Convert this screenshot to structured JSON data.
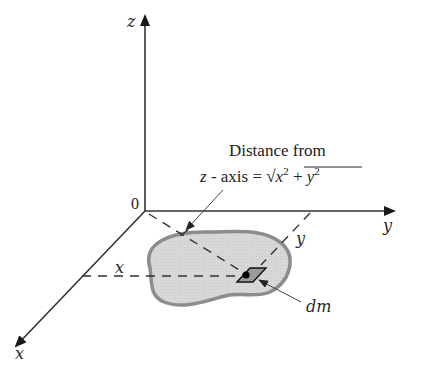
{
  "diagram": {
    "type": "3d-axes-moment-of-inertia",
    "colors": {
      "axis": "#222222",
      "blob_fill": "#d6d6d6",
      "blob_stroke": "#8a8a8a",
      "dashed": "#333333"
    },
    "axes": {
      "origin_label": "0",
      "z_label": "z",
      "y_label": "y",
      "x_label": "x"
    },
    "annotation": {
      "line1": "Distance from",
      "line2_prefix": "z - axis = ",
      "sqrt_symbol": "√",
      "x_var": "x",
      "exp1": "2",
      "plus": " + ",
      "y_var": "y",
      "exp2": "2"
    },
    "dimension_labels": {
      "x_distance": "x",
      "y_distance": "y"
    },
    "element_label": "dm"
  }
}
